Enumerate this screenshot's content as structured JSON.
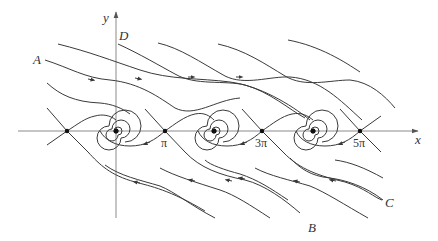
{
  "figure": {
    "axes": {
      "x_label": "x",
      "y_label": "y"
    },
    "tick_labels": [
      {
        "text": "π",
        "value": "pi"
      },
      {
        "text": "3π",
        "value": "3pi"
      },
      {
        "text": "5π",
        "value": "5pi"
      }
    ],
    "trajectory_labels": {
      "A": "A",
      "B": "B",
      "C": "C",
      "D": "D"
    },
    "equilibria": {
      "saddles": [
        "-π",
        "π",
        "3π",
        "5π"
      ],
      "stable_spirals": [
        "0",
        "2π",
        "4π"
      ]
    },
    "colors": {
      "stroke": "#3a3a3a",
      "axis": "#8a8a8a",
      "background": "#ffffff"
    }
  }
}
